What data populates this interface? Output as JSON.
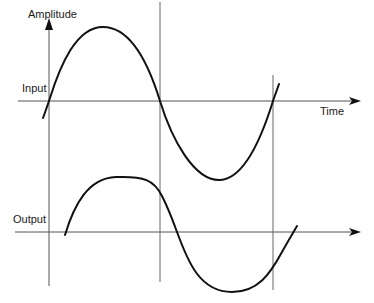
{
  "diagram": {
    "labels": {
      "amplitude": "Amplitude",
      "time": "Time",
      "input": "Input",
      "output": "Output"
    },
    "colors": {
      "curve": "#111111",
      "axis": "#555555",
      "guide": "#666666",
      "text": "#1a1a1a"
    },
    "traces": [
      {
        "name": "input",
        "shape": "sine",
        "description": "Input sine wave crossing zero at the first guide line, peaking, crossing at second guide, trough, crossing at third guide"
      },
      {
        "name": "output",
        "shape": "delayed flattened sine",
        "description": "Output waveform lagging the input, with flattened peak and trough"
      }
    ],
    "guide_lines": 3
  }
}
